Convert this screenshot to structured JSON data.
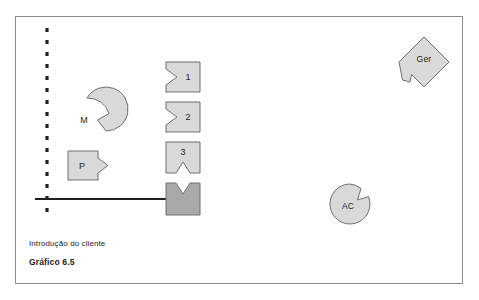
{
  "figure": {
    "frame": {
      "border_color": "#8c8c8c",
      "background": "#ffffff",
      "x": 15,
      "y": 16,
      "width": 448,
      "height": 268
    },
    "palette": {
      "shape_fill_light": "#d9d9d9",
      "shape_fill_dark": "#a9a9a9",
      "shape_stroke": "#6e6e6e",
      "line_color": "#231f20",
      "text_color": "#231f20"
    },
    "divider": {
      "name": "dashed-vertical-line",
      "style": "dashed",
      "x": 47,
      "y_top": 28,
      "y_bottom": 216,
      "color": "#231f20"
    },
    "flow_arrow": {
      "name": "process-flow-arrow",
      "direction": "right",
      "x_start": 35,
      "x_end": 172,
      "y": 199,
      "color": "#231f20"
    },
    "shapes": [
      {
        "id": "shape-m",
        "label": "M",
        "form": "circle-with-notch",
        "notch_side": "right",
        "fill": "light",
        "cx": 87,
        "cy": 120,
        "r": 22
      },
      {
        "id": "shape-p",
        "label": "P",
        "form": "square-with-notch",
        "notch_side": "right",
        "fill": "light",
        "x": 68,
        "y": 151,
        "width": 30,
        "height": 29
      },
      {
        "id": "shape-1",
        "label": "1",
        "form": "square-with-notch",
        "notch_side": "left",
        "fill": "light",
        "x": 166,
        "y": 62,
        "width": 34,
        "height": 30
      },
      {
        "id": "shape-2",
        "label": "2",
        "form": "square-with-notch",
        "notch_side": "left",
        "fill": "light",
        "x": 166,
        "y": 102,
        "width": 34,
        "height": 30
      },
      {
        "id": "shape-3",
        "label": "3",
        "form": "square-with-notch",
        "notch_side": "bottom",
        "fill": "light",
        "x": 166,
        "y": 142,
        "width": 34,
        "height": 31
      },
      {
        "id": "shape-4",
        "label": "",
        "form": "square-with-notch",
        "notch_side": "top",
        "fill": "dark",
        "x": 166,
        "y": 183,
        "width": 34,
        "height": 32
      },
      {
        "id": "shape-ger",
        "label": "Ger",
        "form": "diamond-with-notch",
        "notch_side": "bottom-left",
        "fill": "light",
        "cx": 424,
        "cy": 62,
        "half": 25
      },
      {
        "id": "shape-ac",
        "label": "AC",
        "form": "circle-with-notch",
        "notch_side": "top-right",
        "fill": "light",
        "cx": 350,
        "cy": 204,
        "r": 20
      }
    ],
    "caption": {
      "line_1": "Introdução do cliente",
      "line_2": "Gráfico 6.5"
    }
  }
}
